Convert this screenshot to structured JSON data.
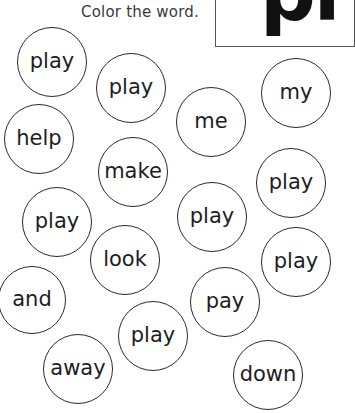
{
  "instruction": "Color the word.",
  "target_word_box": {
    "text": "pl"
  },
  "bubbles": [
    {
      "word": "play",
      "cx": 52,
      "cy": 62,
      "r": 35
    },
    {
      "word": "play",
      "cx": 131,
      "cy": 88,
      "r": 35
    },
    {
      "word": "my",
      "cx": 296,
      "cy": 93,
      "r": 35
    },
    {
      "word": "me",
      "cx": 211,
      "cy": 122,
      "r": 35
    },
    {
      "word": "help",
      "cx": 39,
      "cy": 139,
      "r": 35
    },
    {
      "word": "make",
      "cx": 133,
      "cy": 172,
      "r": 35
    },
    {
      "word": "play",
      "cx": 291,
      "cy": 183,
      "r": 35
    },
    {
      "word": "play",
      "cx": 57,
      "cy": 222,
      "r": 35
    },
    {
      "word": "play",
      "cx": 212,
      "cy": 217,
      "r": 35
    },
    {
      "word": "look",
      "cx": 125,
      "cy": 260,
      "r": 35
    },
    {
      "word": "play",
      "cx": 296,
      "cy": 262,
      "r": 35
    },
    {
      "word": "and",
      "cx": 32,
      "cy": 300,
      "r": 34
    },
    {
      "word": "pay",
      "cx": 225,
      "cy": 302,
      "r": 35
    },
    {
      "word": "play",
      "cx": 153,
      "cy": 336,
      "r": 35
    },
    {
      "word": "away",
      "cx": 78,
      "cy": 369,
      "r": 35
    },
    {
      "word": "down",
      "cx": 268,
      "cy": 375,
      "r": 35
    }
  ]
}
